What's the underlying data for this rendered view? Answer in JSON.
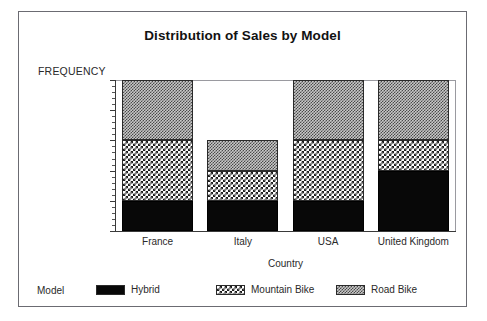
{
  "chart_data": {
    "type": "bar",
    "subtype": "stacked-bar",
    "title": "Distribution of Sales by Model",
    "xlabel": "Country",
    "ylabel": "FREQUENCY",
    "categories": [
      "France",
      "Italy",
      "USA",
      "United Kingdom"
    ],
    "series": [
      {
        "name": "Hybrid",
        "values": [
          1,
          1,
          1,
          2
        ],
        "pattern": "solid-black",
        "color": "#080808"
      },
      {
        "name": "Mountain Bike",
        "values": [
          2,
          1,
          2,
          1
        ],
        "pattern": "white-checker",
        "color": "#ffffff"
      },
      {
        "name": "Road Bike",
        "values": [
          2,
          1,
          2,
          2
        ],
        "pattern": "gray-checker",
        "color": "#c8c8c8"
      }
    ],
    "totals": [
      5,
      3,
      5,
      5
    ],
    "ylim": [
      0,
      5
    ],
    "yticks": [
      0,
      1,
      2,
      3,
      4,
      5
    ],
    "ytick_labels": [
      "0",
      "1",
      "2",
      "3",
      "4",
      "5"
    ],
    "minor_ticks_per_interval": 4,
    "grid": false,
    "legend_position": "bottom",
    "legend_title": "Model",
    "stacked": true
  },
  "legend": {
    "title": "Model",
    "entries": [
      {
        "label": "Hybrid"
      },
      {
        "label": "Mountain Bike"
      },
      {
        "label": "Road Bike"
      }
    ]
  },
  "axes": {
    "y_title": "FREQUENCY",
    "x_title": "Country"
  }
}
